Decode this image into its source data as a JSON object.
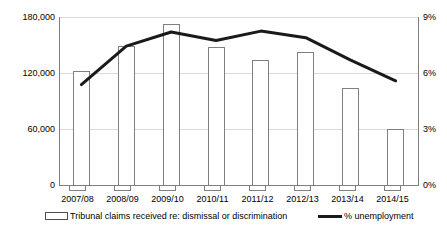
{
  "chart_data": {
    "type": "bar",
    "title": "",
    "xlabel": "",
    "ylabel": "",
    "grid": true,
    "legend_position": "bottom",
    "categories": [
      "2007/08",
      "2008/09",
      "2009/10",
      "2010/11",
      "2011/12",
      "2012/13",
      "2013/14",
      "2014/15"
    ],
    "axes": {
      "left": {
        "label": "",
        "ticks": [
          "0",
          "60,000",
          "120,000",
          "180,000"
        ],
        "tick_values": [
          0,
          60000,
          120000,
          180000
        ],
        "ylim": [
          0,
          180000
        ]
      },
      "right": {
        "label": "",
        "ticks": [
          "0%",
          "3%",
          "6%",
          "9%"
        ],
        "tick_values": [
          0,
          3,
          6,
          9
        ],
        "ylim": [
          0,
          9
        ]
      }
    },
    "series": [
      {
        "name": "Tribunal claims received re: dismissal or discrimination",
        "type": "bar",
        "axis": "left",
        "color": "#808080",
        "fill": "#ffffff",
        "values": [
          122500,
          149000,
          172500,
          148000,
          134000,
          143000,
          104000,
          60500
        ]
      },
      {
        "name": "% unemployment",
        "type": "line",
        "axis": "right",
        "color": "#1a1a1a",
        "values": [
          5.4,
          7.45,
          8.2,
          7.75,
          8.25,
          7.9,
          6.7,
          5.6
        ]
      }
    ]
  },
  "legend": {
    "items": [
      {
        "label": "Tribunal claims received re: dismissal or discrimination",
        "marker": "open-bar-swatch"
      },
      {
        "label": "% unemployment",
        "marker": "thick-line-swatch"
      }
    ]
  }
}
